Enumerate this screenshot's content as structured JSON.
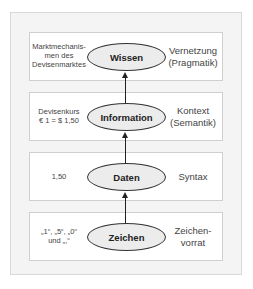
{
  "diagram": {
    "layers": [
      {
        "node": "Wissen",
        "left": [
          "Marktmechanis-",
          "men des",
          "Devisenmarktes"
        ],
        "right": [
          "Vernetzung",
          "(Pragmatik)"
        ]
      },
      {
        "node": "Information",
        "left": [
          "Devisenkurs",
          "€ 1 = $ 1,50"
        ],
        "right": [
          "Kontext",
          "(Semantik)"
        ]
      },
      {
        "node": "Daten",
        "left": [
          "1,50"
        ],
        "right": [
          "Syntax"
        ]
      },
      {
        "node": "Zeichen",
        "left": [
          "„1“, „5“, „0“",
          "und „,“"
        ],
        "right": [
          "Zeichen-",
          "vorrat"
        ]
      }
    ],
    "colors": {
      "frame_bg": "#f4f4f4",
      "layer_bg": "#ffffff",
      "ellipse_fill": "#ececec",
      "stroke": "#333333"
    }
  }
}
